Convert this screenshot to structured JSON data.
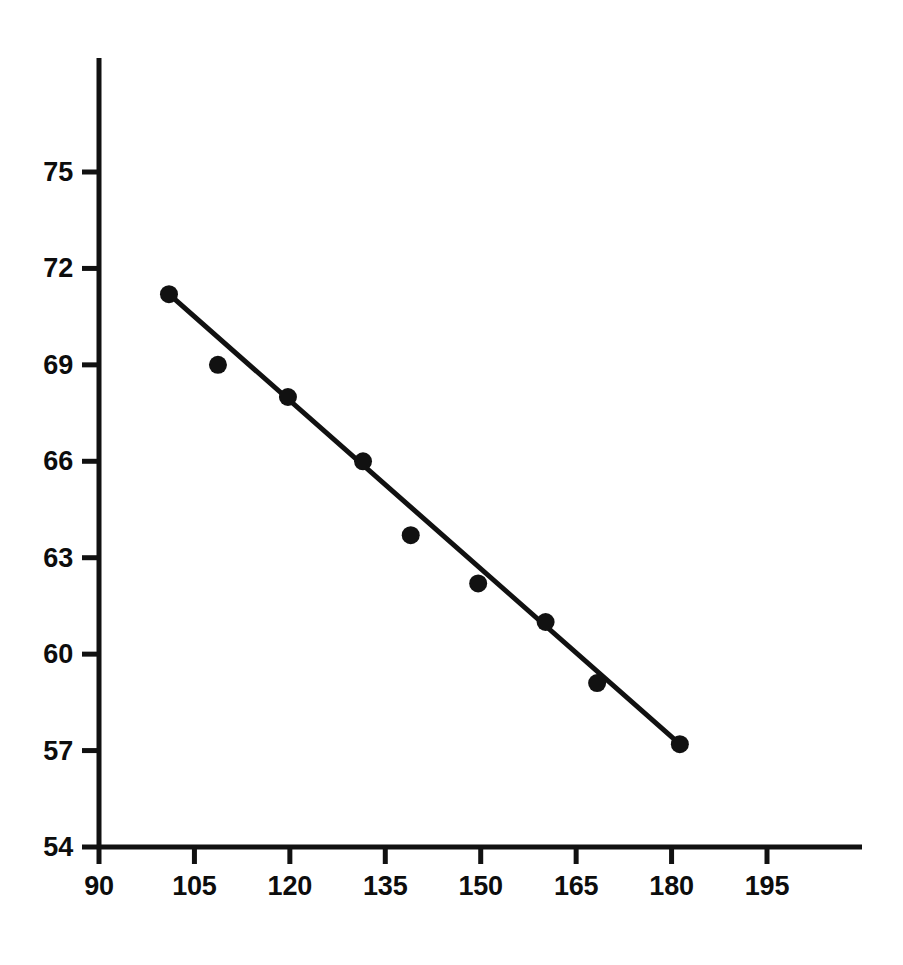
{
  "chart_data": {
    "type": "scatter",
    "title": "",
    "subtitle": "",
    "xlabel": "",
    "ylabel": "",
    "xlim": [
      90,
      205
    ],
    "ylim": [
      54,
      76.8
    ],
    "xticks": [
      90,
      105,
      120,
      135,
      150,
      165,
      180,
      195
    ],
    "yticks": [
      54,
      57,
      60,
      63,
      66,
      69,
      72,
      75
    ],
    "xtick_labels": [
      "90",
      "105",
      "120",
      "135",
      "150",
      "165",
      "180",
      "195"
    ],
    "ytick_labels": [
      "54",
      "57",
      "60",
      "63",
      "66",
      "69",
      "72",
      "75"
    ],
    "grid": false,
    "legend": null,
    "annotations": [],
    "series": [
      {
        "name": "observations",
        "type": "scatter",
        "marker": "filled-circle",
        "color": "#111111",
        "marker_radius_px": 9,
        "x": [
          101.0,
          108.7,
          119.7,
          131.5,
          139.0,
          149.6,
          160.2,
          168.3,
          181.3
        ],
        "y": [
          71.2,
          69.0,
          68.0,
          66.0,
          63.7,
          62.2,
          61.0,
          59.1,
          57.2
        ],
        "points": [
          {
            "x": 101.0,
            "y": 71.2
          },
          {
            "x": 108.7,
            "y": 69.0
          },
          {
            "x": 119.7,
            "y": 68.0
          },
          {
            "x": 131.5,
            "y": 66.0
          },
          {
            "x": 139.0,
            "y": 63.7
          },
          {
            "x": 149.6,
            "y": 62.2
          },
          {
            "x": 160.2,
            "y": 61.0
          },
          {
            "x": 168.3,
            "y": 59.1
          },
          {
            "x": 181.3,
            "y": 57.2
          }
        ]
      },
      {
        "name": "fitted-trend-line",
        "type": "line",
        "color": "#111111",
        "line_width_px": 5,
        "x": [
          101.0,
          181.3
        ],
        "y": [
          71.2,
          57.2
        ]
      }
    ]
  },
  "axes": {
    "axis_color": "#111111",
    "axis_line_width_px": 5,
    "tick_length_px": 17,
    "x_axis_pixel": {
      "y": 847,
      "x_start": 99,
      "x_end": 862
    },
    "y_axis_pixel": {
      "x": 99,
      "y_start": 58,
      "y_end": 847
    },
    "x_pixel_for_min": 99,
    "x_pixel_for_max_tick": 767,
    "y_pixel_for_min": 847,
    "y_pixel_for_max_tick": 172
  }
}
